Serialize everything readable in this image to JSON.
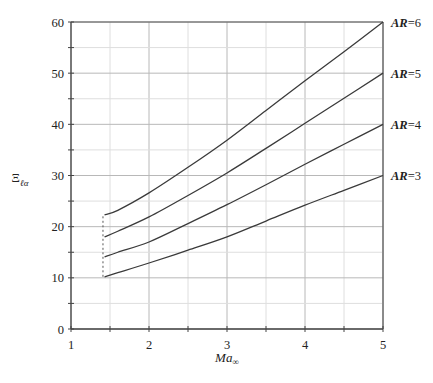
{
  "chart_data": {
    "type": "line",
    "title": "",
    "xlabel": "Ma_∞",
    "ylabel": "Ξ_ℓα",
    "xlim": [
      1,
      5
    ],
    "ylim": [
      0,
      60
    ],
    "xticks": [
      1,
      2,
      3,
      4,
      5
    ],
    "yticks": [
      0,
      10,
      20,
      30,
      40,
      50,
      60
    ],
    "grid": {
      "major": true,
      "minor": true,
      "x_minor_step": 0.5,
      "y_minor_step": 5
    },
    "legend": "inline labels at right end of curves",
    "series": [
      {
        "name": "AR = 3",
        "x": [
          1.43,
          1.6,
          2.0,
          2.5,
          3.0,
          3.5,
          4.0,
          4.5,
          5.0
        ],
        "y": [
          10.2,
          11.0,
          12.9,
          15.4,
          18.0,
          21.1,
          24.2,
          27.1,
          30.0
        ]
      },
      {
        "name": "AR = 4",
        "x": [
          1.43,
          1.6,
          2.0,
          2.5,
          3.0,
          3.5,
          4.0,
          4.5,
          5.0
        ],
        "y": [
          14.1,
          15.0,
          17.0,
          20.6,
          24.3,
          28.2,
          32.2,
          36.1,
          40.0
        ]
      },
      {
        "name": "AR = 5",
        "x": [
          1.43,
          1.6,
          2.0,
          2.5,
          3.0,
          3.5,
          4.0,
          4.5,
          5.0
        ],
        "y": [
          18.0,
          19.1,
          21.9,
          26.1,
          30.5,
          35.3,
          40.2,
          45.1,
          50.0
        ]
      },
      {
        "name": "AR = 6",
        "x": [
          1.43,
          1.6,
          2.0,
          2.5,
          3.0,
          3.5,
          4.0,
          4.5,
          5.0
        ],
        "y": [
          22.3,
          23.2,
          26.6,
          31.6,
          36.9,
          42.7,
          48.5,
          54.2,
          60.0
        ]
      }
    ],
    "annotations": [
      {
        "type": "dashed-vertical-line",
        "x": 1.41,
        "y_from": 10.2,
        "y_to": 22.3
      }
    ]
  },
  "labels": {
    "x_ticks": [
      "1",
      "2",
      "3",
      "4",
      "5"
    ],
    "y_ticks": [
      "0",
      "10",
      "20",
      "30",
      "40",
      "50",
      "60"
    ],
    "ar_prefix": "AR",
    "ar_values": [
      "=6",
      "=5",
      "=4",
      "=3"
    ],
    "x_title_main": "Ma",
    "x_title_sub": "∞",
    "y_title_main": "Ξ",
    "y_title_sub": "ℓα"
  }
}
